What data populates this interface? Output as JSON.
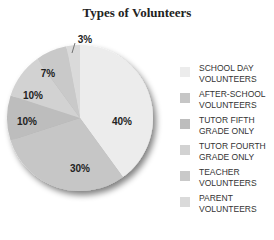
{
  "chart_data": {
    "type": "pie",
    "title": "Types of Volunteers",
    "categories": [
      "SCHOOL DAY VOLUNTEERS",
      "AFTER-SCHOOL VOLUNTEERS",
      "TUTOR FIFTH GRADE ONLY",
      "TUTOR FOURTH GRADE ONLY",
      "TEACHER VOLUNTEERS",
      "PARENT VOLUNTEERS"
    ],
    "values": [
      40,
      30,
      10,
      10,
      7,
      3
    ],
    "labels": [
      "40%",
      "30%",
      "10%",
      "10%",
      "7%",
      "3%"
    ],
    "colors": [
      "#ececec",
      "#c6c6c6",
      "#bdbdbd",
      "#d2d2d2",
      "#c9c9c9",
      "#dadada"
    ],
    "legend_position": "right"
  },
  "legend": [
    {
      "label": "SCHOOL DAY\nVOLUNTEERS",
      "color": "#ececec"
    },
    {
      "label": "AFTER-SCHOOL\nVOLUNTEERS",
      "color": "#c6c6c6"
    },
    {
      "label": "TUTOR FIFTH\nGRADE ONLY",
      "color": "#bdbdbd"
    },
    {
      "label": "TUTOR FOURTH\nGRADE ONLY",
      "color": "#d2d2d2"
    },
    {
      "label": "TEACHER\nVOLUNTEERS",
      "color": "#c9c9c9"
    },
    {
      "label": "PARENT\nVOLUNTEERS",
      "color": "#dadada"
    }
  ]
}
